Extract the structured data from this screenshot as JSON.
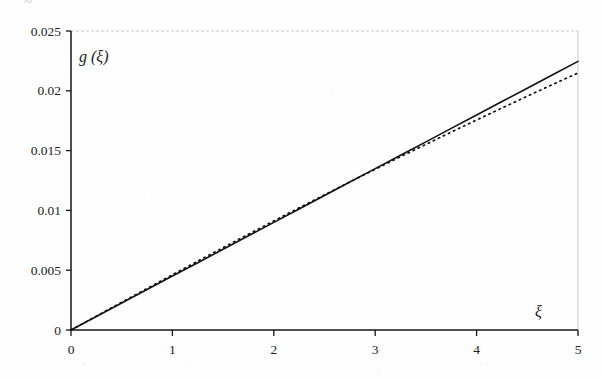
{
  "figure": {
    "background_color": "#fefefe",
    "ink_color": "#1a1a1a",
    "frame_color": "#c9c9cc",
    "page_bleed_text": "~"
  },
  "chart_data": {
    "type": "line",
    "title": "",
    "subtitle": "",
    "xlabel": "ξ",
    "ylabel": "g (ξ)",
    "xlim": [
      0,
      5
    ],
    "ylim": [
      0,
      0.025
    ],
    "grid": false,
    "legend": "none",
    "xticks": [
      0,
      1,
      2,
      3,
      4,
      5
    ],
    "xtick_labels": [
      "0",
      "1",
      "2",
      "3",
      "4",
      "5"
    ],
    "yticks": [
      0,
      0.005,
      0.01,
      0.015,
      0.02,
      0.025
    ],
    "ytick_labels": [
      "0",
      "0.005",
      "0.01",
      "0.015",
      "0.02",
      "0.025"
    ],
    "series": [
      {
        "name": "solid-curve",
        "style": "solid",
        "color": "#111111",
        "linewidth": 1.6,
        "x": [
          0,
          0.25,
          0.5,
          0.75,
          1,
          1.25,
          1.5,
          1.75,
          2,
          2.25,
          2.5,
          2.75,
          3,
          3.25,
          3.5,
          3.75,
          4,
          4.25,
          4.5,
          4.75,
          5
        ],
        "y": [
          0,
          0.00113,
          0.00226,
          0.00338,
          0.00451,
          0.00563,
          0.00675,
          0.00788,
          0.009,
          0.01012,
          0.01124,
          0.01237,
          0.01349,
          0.01461,
          0.01573,
          0.01686,
          0.01798,
          0.0191,
          0.02022,
          0.02134,
          0.02246
        ]
      },
      {
        "name": "dotted-curve",
        "style": "dotted",
        "color": "#111111",
        "linewidth": 1.7,
        "x": [
          0,
          0.25,
          0.5,
          0.75,
          1,
          1.25,
          1.5,
          1.75,
          2,
          2.25,
          2.5,
          2.75,
          3,
          3.25,
          3.5,
          3.75,
          4,
          4.25,
          4.5,
          4.75,
          5
        ],
        "y": [
          0,
          0.00116,
          0.00232,
          0.00347,
          0.00462,
          0.00576,
          0.00689,
          0.00801,
          0.00912,
          0.01022,
          0.0113,
          0.01238,
          0.01344,
          0.01449,
          0.01552,
          0.01655,
          0.01756,
          0.01856,
          0.01955,
          0.02053,
          0.02149
        ]
      }
    ]
  },
  "geometry": {
    "plot_left_px": 71,
    "plot_right_px": 578,
    "plot_top_px": 31,
    "plot_bottom_px": 330
  }
}
